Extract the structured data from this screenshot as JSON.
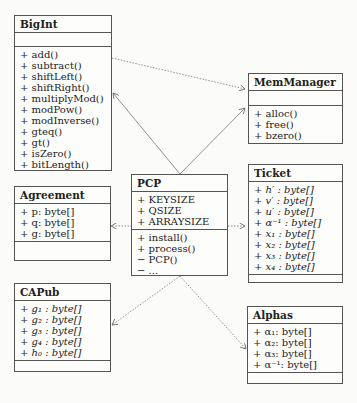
{
  "classes": {
    "bigint": {
      "name": "BigInt",
      "attributes": [],
      "methods": [
        "+ add()",
        "+ subtract()",
        "+ shiftLeft()",
        "+ shiftRight()",
        "+ multiplyMod()",
        "+ modPow()",
        "+ modInverse()",
        "+ gteq()",
        "+ gt()",
        "+ isZero()",
        "+ bitLength()"
      ]
    },
    "memmanager": {
      "name": "MemManager",
      "attributes": [],
      "methods": [
        "+ alloc()",
        "+ free()",
        "+ bzero()"
      ]
    },
    "ticket": {
      "name": "Ticket",
      "attributes": [
        "+ h′ : byte[]",
        "+ v′ : byte[]",
        "+ u′ : byte[]",
        "+ α⁻¹ : byte[]",
        "+ x₁ : byte[]",
        "+ x₂ : byte[]",
        "+ x₃ : byte[]",
        "+ x₄ : byte[]"
      ],
      "methods": []
    },
    "agreement": {
      "name": "Agreement",
      "attributes": [
        "+ p: byte[]",
        "+ q: byte[]",
        "+ g: byte[]"
      ],
      "methods": []
    },
    "pcp": {
      "name": "PCP",
      "attributes": [
        "+ KEYSIZE",
        "+ QSIZE",
        "+ ARRAYSIZE"
      ],
      "methods": [
        "+ install()",
        "+ process()",
        "− PCP()",
        "− ..."
      ]
    },
    "capub": {
      "name": "CAPub",
      "attributes": [
        "+ g₁ : byte[]",
        "+ g₂ : byte[]",
        "+ g₃ : byte[]",
        "+ g₄ : byte[]",
        "+ h₀ : byte[]"
      ],
      "methods": []
    },
    "alphas": {
      "name": "Alphas",
      "attributes": [
        "+ α₁: byte[]",
        "+ α₂: byte[]",
        "+ α₃: byte[]",
        "+ α⁻¹: byte[]"
      ],
      "methods": []
    }
  },
  "relations": [
    {
      "from": "PCP",
      "to": "BigInt",
      "style": "solid"
    },
    {
      "from": "PCP",
      "to": "MemManager",
      "style": "solid"
    },
    {
      "from": "BigInt",
      "to": "MemManager",
      "style": "dotted"
    },
    {
      "from": "PCP",
      "to": "Agreement",
      "style": "dotted"
    },
    {
      "from": "PCP",
      "to": "Ticket",
      "style": "dotted"
    },
    {
      "from": "PCP",
      "to": "CAPub",
      "style": "dotted"
    },
    {
      "from": "PCP",
      "to": "Alphas",
      "style": "dotted"
    }
  ]
}
